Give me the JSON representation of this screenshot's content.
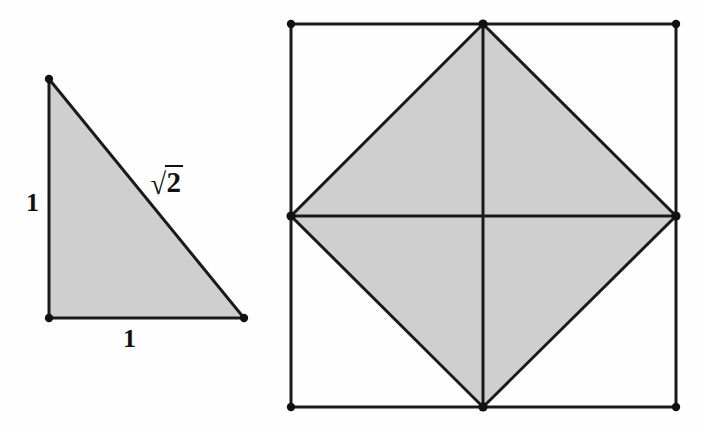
{
  "figure": {
    "background_color": "#fefefe",
    "fill_color": "#cfcfcf",
    "stroke_color": "#1a1a1a",
    "vertex_dot_color": "#111111"
  },
  "triangle": {
    "name": "unit-right-triangle",
    "vertices": [
      {
        "name": "apex",
        "x": 49,
        "y": 79
      },
      {
        "name": "right-angle",
        "x": 49,
        "y": 318
      },
      {
        "name": "base-right",
        "x": 244,
        "y": 318
      }
    ],
    "labels": {
      "vertical_leg": "1",
      "horizontal_leg": "1",
      "hypotenuse_radical": "√",
      "hypotenuse_radicand": "2"
    }
  },
  "square_figure": {
    "name": "square-with-inscribed-square",
    "square_corners": [
      {
        "name": "top-left",
        "x": 291,
        "y": 24
      },
      {
        "name": "top-right",
        "x": 676,
        "y": 24
      },
      {
        "name": "bottom-right",
        "x": 676,
        "y": 407
      },
      {
        "name": "bottom-left",
        "x": 291,
        "y": 407
      }
    ],
    "diamond_vertices": [
      {
        "name": "top-mid",
        "x": 483,
        "y": 24
      },
      {
        "name": "right-mid",
        "x": 676,
        "y": 216
      },
      {
        "name": "bottom-mid",
        "x": 483,
        "y": 407
      },
      {
        "name": "left-mid",
        "x": 291,
        "y": 216
      }
    ],
    "center": {
      "name": "center",
      "x": 483,
      "y": 216
    },
    "median_lines": [
      {
        "name": "vertical-median",
        "x1": 483,
        "y1": 24,
        "x2": 483,
        "y2": 407
      },
      {
        "name": "horizontal-median",
        "x1": 291,
        "y1": 216,
        "x2": 676,
        "y2": 216
      }
    ]
  },
  "chart_data": {
    "type": "diagram",
    "shapes": [
      {
        "name": "unit-right-triangle",
        "kind": "polygon",
        "points": [
          [
            49,
            79
          ],
          [
            49,
            318
          ],
          [
            244,
            318
          ]
        ],
        "fill": "#cfcfcf",
        "stroke": "#1a1a1a",
        "edge_labels": {
          "left_leg": "1",
          "bottom_leg": "1",
          "hypotenuse": "√2"
        }
      },
      {
        "name": "outer-square",
        "kind": "polygon",
        "points": [
          [
            291,
            24
          ],
          [
            676,
            24
          ],
          [
            676,
            407
          ],
          [
            291,
            407
          ]
        ],
        "fill": "none",
        "stroke": "#1a1a1a"
      },
      {
        "name": "inscribed-rotated-square",
        "kind": "polygon",
        "points": [
          [
            483,
            24
          ],
          [
            676,
            216
          ],
          [
            483,
            407
          ],
          [
            291,
            216
          ]
        ],
        "fill": "#cfcfcf",
        "stroke": "#1a1a1a"
      }
    ],
    "annotations": [
      "1",
      "1",
      "√2"
    ]
  }
}
